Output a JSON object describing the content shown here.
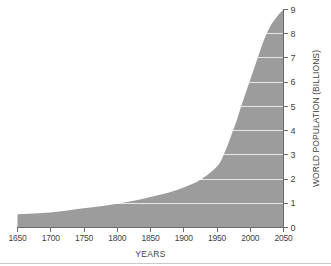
{
  "chart_data": {
    "type": "area",
    "title": "",
    "xlabel": "YEARS",
    "ylabel": "WORLD POPULATION (BILLIONS)",
    "xlim": [
      1650,
      2050
    ],
    "ylim": [
      0,
      9
    ],
    "grid": true,
    "legend": null,
    "series_name": "World population",
    "fill_color": "#9c9c9c",
    "grid_color": "#ffffff",
    "axis_color": "#6a6a6a",
    "background_color": "#ffffff",
    "x": [
      1650,
      1700,
      1750,
      1800,
      1850,
      1900,
      1950,
      2000,
      2050
    ],
    "values": [
      0.55,
      0.62,
      0.79,
      0.98,
      1.26,
      1.65,
      2.52,
      6.1,
      9.0
    ],
    "x_dense": [
      1650,
      1675,
      1700,
      1725,
      1750,
      1775,
      1800,
      1825,
      1850,
      1875,
      1900,
      1925,
      1950,
      1960,
      1970,
      1980,
      1990,
      2000,
      2010,
      2020,
      2030,
      2040,
      2050
    ],
    "values_dense": [
      0.55,
      0.58,
      0.62,
      0.7,
      0.79,
      0.88,
      0.98,
      1.1,
      1.26,
      1.42,
      1.65,
      1.97,
      2.52,
      3.0,
      3.7,
      4.45,
      5.3,
      6.1,
      6.9,
      7.7,
      8.3,
      8.7,
      9.0
    ],
    "xticks": [
      1650,
      1700,
      1750,
      1800,
      1850,
      1900,
      1950,
      2000,
      2050
    ],
    "xtick_labels": [
      "1650",
      "1700",
      "1750",
      "1800",
      "1850",
      "1900",
      "1950",
      "2000",
      "2050"
    ],
    "yticks": [
      0,
      1,
      2,
      3,
      4,
      5,
      6,
      7,
      8,
      9
    ],
    "ytick_labels": [
      "0",
      "1",
      "2",
      "3",
      "4",
      "5",
      "6",
      "7",
      "8",
      "9"
    ]
  }
}
